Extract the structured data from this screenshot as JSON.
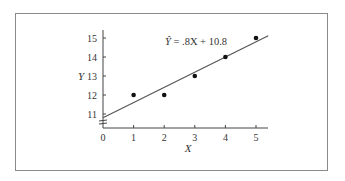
{
  "chart_data": {
    "type": "scatter",
    "title": "",
    "xlabel": "X",
    "ylabel": "Y",
    "x_ticks": [
      "0",
      "1",
      "2",
      "3",
      "4",
      "5"
    ],
    "y_ticks": [
      "11",
      "12",
      "13",
      "14",
      "15"
    ],
    "xlim": [
      0,
      5.4
    ],
    "ylim": [
      10.4,
      15.5
    ],
    "y_axis_break": true,
    "grid": false,
    "series": [
      {
        "name": "observed",
        "type": "scatter",
        "x": [
          1,
          2,
          3,
          4,
          5
        ],
        "y": [
          12,
          12,
          13,
          14,
          15
        ]
      },
      {
        "name": "regression line",
        "type": "line",
        "slope": 0.8,
        "intercept": 10.8,
        "x": [
          0,
          5.4
        ],
        "y": [
          10.8,
          15.12
        ]
      }
    ],
    "annotations": [
      {
        "text_hat": "Ŷ",
        "text_rest": " = .8X + 10.8",
        "x": 2.0,
        "y": 15.1
      }
    ]
  }
}
